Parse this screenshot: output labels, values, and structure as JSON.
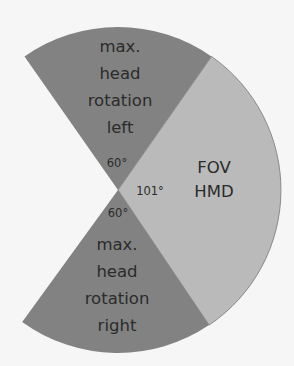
{
  "diagram": {
    "colors": {
      "background": "#f6f6f6",
      "head_rotation_sector": "#828282",
      "fov_sector": "#bababa",
      "sector_outline": "#8a8a8a",
      "text": "#2b2b2b"
    },
    "sectors": [
      {
        "id": "left",
        "label_lines": [
          "max.",
          "head",
          "rotation",
          "left"
        ],
        "angle_label": "60°",
        "angle_deg": 60
      },
      {
        "id": "fov",
        "label_lines": [
          "FOV",
          "HMD"
        ],
        "angle_label": "101°",
        "angle_deg": 101
      },
      {
        "id": "right",
        "label_lines": [
          "max.",
          "head",
          "rotation",
          "right"
        ],
        "angle_label": "60°",
        "angle_deg": 60
      }
    ]
  }
}
